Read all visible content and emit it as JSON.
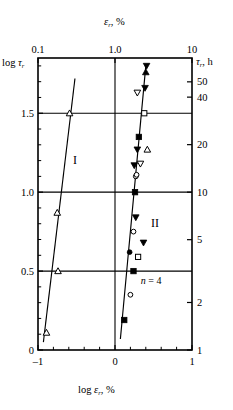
{
  "chart_data": {
    "type": "scatter",
    "title": "",
    "xlabel": "log εᵣ, %",
    "ylabel": "log τᵣ",
    "top_axis_label": "εᵣ, %",
    "right_axis_label": "τᵣ, h",
    "xlim": [
      -1,
      1
    ],
    "ylim": [
      0,
      1.85
    ],
    "grid": true,
    "legend_position": "none",
    "axes": {
      "bottom": {
        "label_prefix": "log ",
        "label_symbol": "ε",
        "label_sub": "r",
        "label_suffix": ", %",
        "ticks": [
          -1,
          0,
          1
        ],
        "tick_labels": [
          "–1",
          "0",
          "1"
        ],
        "minor_ticks": [
          -0.8,
          -0.6,
          -0.4,
          -0.2,
          0.2,
          0.4,
          0.6,
          0.8
        ]
      },
      "left": {
        "label_prefix": "log ",
        "label_symbol": "τ",
        "label_sub": "r",
        "ticks": [
          0,
          0.5,
          1.0,
          1.5
        ],
        "tick_labels": [
          "0",
          "0.5",
          "1.0",
          "1.5"
        ],
        "minor_ticks": [
          0.1,
          0.2,
          0.3,
          0.4,
          0.6,
          0.7,
          0.8,
          0.9,
          1.1,
          1.2,
          1.3,
          1.4,
          1.6,
          1.7,
          1.8
        ]
      },
      "top": {
        "label_symbol": "ε",
        "label_sub": "r",
        "label_suffix": ", %",
        "ticks": [
          -1,
          0,
          1
        ],
        "tick_labels": [
          "0.1",
          "1.0",
          "10"
        ]
      },
      "right": {
        "label_symbol": "τ",
        "label_sub": "r",
        "label_suffix": ", h",
        "tick_values": [
          1,
          2,
          5,
          10,
          20,
          40,
          50
        ],
        "tick_labels": [
          "1",
          "2",
          "5",
          "10",
          "20",
          "40",
          "50"
        ]
      }
    },
    "gridlines": {
      "horizontal": [
        0.5,
        1.0,
        1.5
      ],
      "vertical": [
        0.0
      ]
    },
    "annotations": [
      {
        "text": "I",
        "x": -0.52,
        "y": 1.18,
        "name": "region-one-label"
      },
      {
        "text": "II",
        "x": 0.52,
        "y": 0.78,
        "name": "region-two-label"
      },
      {
        "text": "n = 4",
        "x": 0.47,
        "y": 0.42,
        "name": "slope-exponent-label"
      }
    ],
    "series": [
      {
        "name": "branch-I",
        "marker": "open-triangle-up",
        "fit_line": {
          "x1": -0.93,
          "y1": 0.05,
          "x2": -0.52,
          "y2": 1.72
        },
        "points": [
          {
            "x": -0.89,
            "y": 0.11
          },
          {
            "x": -0.74,
            "y": 0.5
          },
          {
            "x": -0.75,
            "y": 0.87
          },
          {
            "x": -0.59,
            "y": 1.5
          }
        ]
      },
      {
        "name": "branch-II",
        "marker": "mixed",
        "fit_line": {
          "x1": 0.07,
          "y1": 0.07,
          "x2": 0.4,
          "y2": 1.8
        },
        "points": [
          {
            "x": 0.12,
            "y": 0.19,
            "marker": "filled-square"
          },
          {
            "x": 0.2,
            "y": 0.35,
            "marker": "open-circle"
          },
          {
            "x": 0.24,
            "y": 0.5,
            "marker": "filled-square"
          },
          {
            "x": 0.3,
            "y": 0.59,
            "marker": "open-square"
          },
          {
            "x": 0.19,
            "y": 0.62,
            "marker": "filled-circle"
          },
          {
            "x": 0.37,
            "y": 0.68,
            "marker": "filled-triangle-down"
          },
          {
            "x": 0.24,
            "y": 0.75,
            "marker": "open-circle"
          },
          {
            "x": 0.27,
            "y": 0.84,
            "marker": "filled-triangle-down"
          },
          {
            "x": 0.26,
            "y": 1.0,
            "marker": "filled-square"
          },
          {
            "x": 0.27,
            "y": 1.1,
            "marker": "open-circle"
          },
          {
            "x": 0.28,
            "y": 1.11,
            "marker": "open-circle"
          },
          {
            "x": 0.25,
            "y": 1.17,
            "marker": "filled-triangle-down"
          },
          {
            "x": 0.33,
            "y": 1.18,
            "marker": "open-triangle-down"
          },
          {
            "x": 0.29,
            "y": 1.27,
            "marker": "filled-triangle-down"
          },
          {
            "x": 0.42,
            "y": 1.27,
            "marker": "open-triangle-up"
          },
          {
            "x": 0.31,
            "y": 1.35,
            "marker": "filled-square"
          },
          {
            "x": 0.38,
            "y": 1.5,
            "marker": "open-square"
          },
          {
            "x": 0.29,
            "y": 1.63,
            "marker": "open-triangle-down"
          },
          {
            "x": 0.39,
            "y": 1.66,
            "marker": "filled-triangle-down"
          },
          {
            "x": 0.4,
            "y": 1.76,
            "marker": "filled-triangle-up"
          },
          {
            "x": 0.41,
            "y": 1.8,
            "marker": "filled-triangle-down"
          }
        ]
      }
    ]
  }
}
